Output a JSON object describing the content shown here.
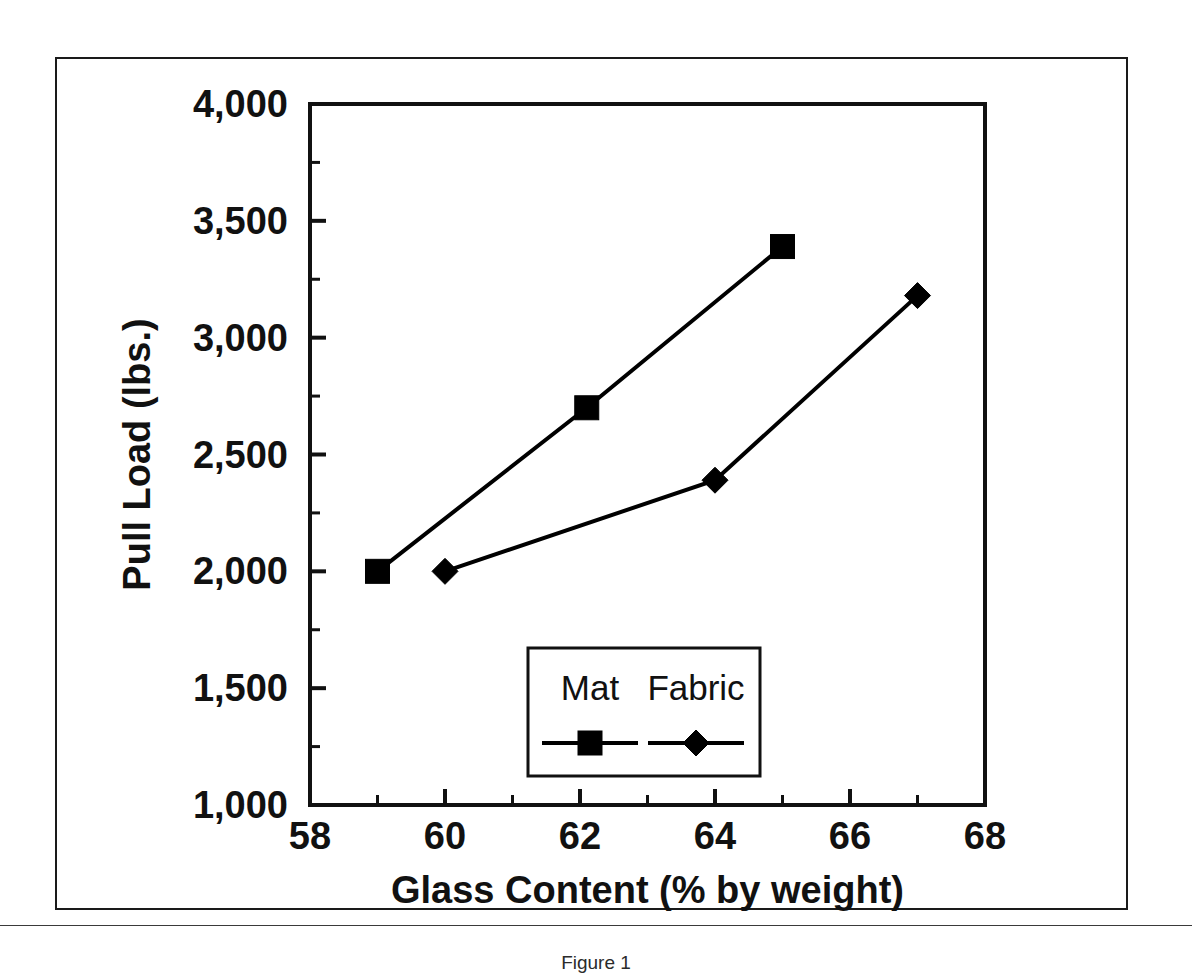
{
  "figure": {
    "caption": "Figure 1"
  },
  "chart_data": {
    "type": "line",
    "title": "",
    "xlabel": "Glass Content (% by weight)",
    "ylabel": "Pull Load (lbs.)",
    "xlim": [
      58,
      68
    ],
    "ylim": [
      1000,
      4000
    ],
    "xticks": [
      58,
      60,
      62,
      64,
      66,
      68
    ],
    "xtick_labels": [
      "58",
      "60",
      "62",
      "64",
      "66",
      "68"
    ],
    "x_minor_tick_step": 1,
    "yticks": [
      1000,
      1500,
      2000,
      2500,
      3000,
      3500,
      4000
    ],
    "ytick_labels": [
      "1,000",
      "1,500",
      "2,000",
      "2,500",
      "3,000",
      "3,500",
      "4,000"
    ],
    "y_minor_tick_step": 250,
    "grid": false,
    "legend_position": "lower center",
    "series": [
      {
        "name": "Mat",
        "marker": "square",
        "color": "#000000",
        "x": [
          59,
          62.1,
          65
        ],
        "y": [
          2000,
          2700,
          3390
        ]
      },
      {
        "name": "Fabric",
        "marker": "diamond",
        "color": "#000000",
        "x": [
          60,
          64,
          67
        ],
        "y": [
          2000,
          2390,
          3180
        ]
      }
    ]
  },
  "legend": {
    "entries": [
      {
        "label": "Mat",
        "marker": "square"
      },
      {
        "label": "Fabric",
        "marker": "diamond"
      }
    ]
  }
}
